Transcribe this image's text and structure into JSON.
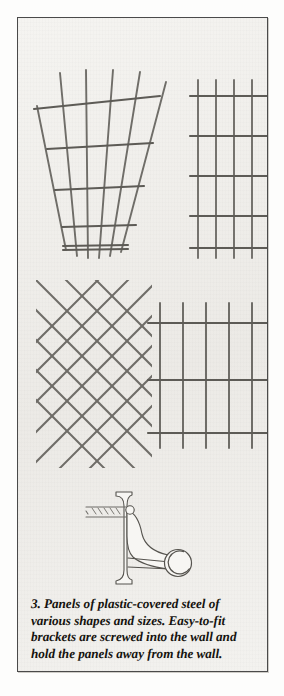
{
  "figure": {
    "number": "3",
    "caption_lines": [
      "3. Panels of plastic-covered steel of",
      "various shapes and sizes. Easy-to-fit",
      "brackets are screwed into the wall and",
      "hold the panels away from the wall."
    ],
    "caption_full": "3. Panels of plastic-covered steel of various shapes and sizes. Easy-to-fit brackets are screwed into the wall and hold the panels away from the wall.",
    "colors": {
      "border": "#4a4a4a",
      "paper": "#f2f1ee",
      "page": "#ffffff",
      "wire": "#6f6d68",
      "wire_dark": "#55534e",
      "ink": "#15130f"
    },
    "panels": [
      {
        "id": "fan-panel",
        "name": "fan-shaped trellis panel",
        "shape": "fan",
        "vertical_bars": 6,
        "horizontal_bars": 5,
        "bounds": {
          "x": 20,
          "y": 62,
          "width": 120,
          "height": 182
        }
      },
      {
        "id": "narrow-grid-panel",
        "name": "narrow rectangular mesh panel",
        "shape": "rectangular-grid",
        "vertical_bars": 5,
        "horizontal_bars": 5,
        "bounds": {
          "x": 178,
          "y": 68,
          "width": 80,
          "height": 180
        }
      },
      {
        "id": "diamond-lattice-panel",
        "name": "diagonal diamond lattice panel",
        "shape": "diagonal-lattice",
        "diagonal_bars_down": 7,
        "diagonal_bars_up": 7,
        "bounds": {
          "x": 22,
          "y": 288,
          "width": 108,
          "height": 174
        }
      },
      {
        "id": "wide-grid-panel",
        "name": "wide square mesh panel",
        "shape": "rectangular-grid",
        "vertical_bars": 6,
        "horizontal_bars": 3,
        "bounds": {
          "x": 140,
          "y": 300,
          "width": 125,
          "height": 130
        }
      }
    ],
    "bracket": {
      "id": "wall-bracket",
      "name": "easy-to-fit wall bracket",
      "parts": [
        "wall-plate",
        "fixing-screw",
        "curved-arm",
        "c-clip-hook"
      ],
      "bounds": {
        "x": 100,
        "y": 488,
        "width": 92,
        "height": 82
      }
    }
  }
}
